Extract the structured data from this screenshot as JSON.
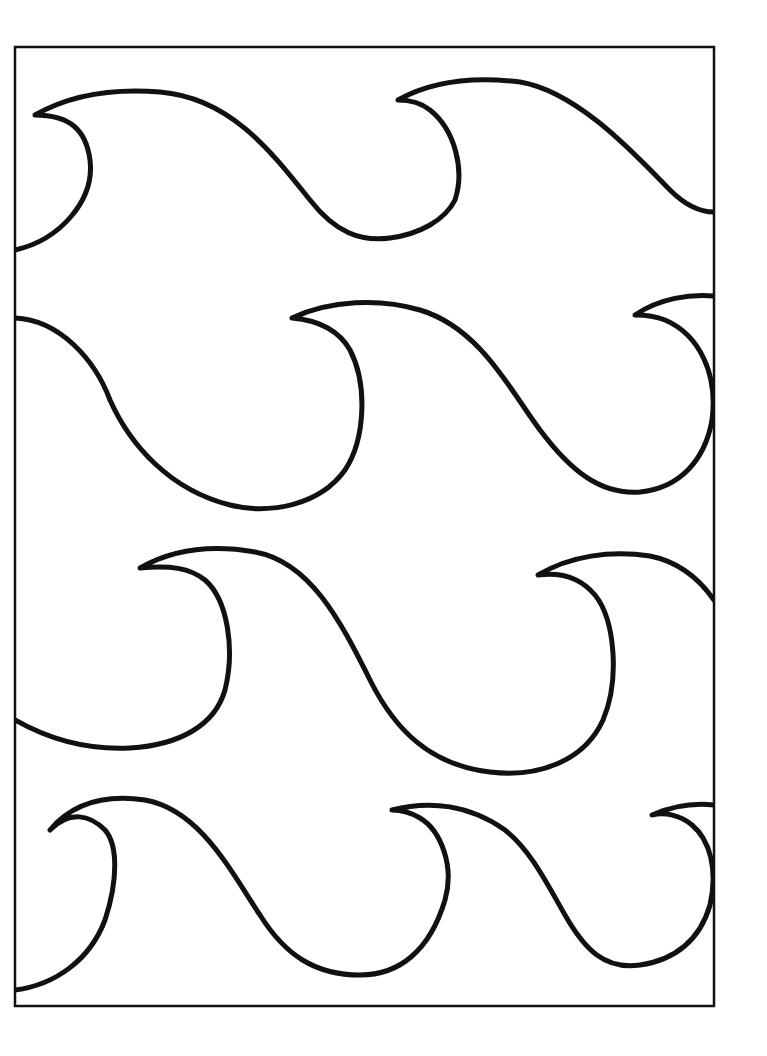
{
  "page": {
    "title": ""
  },
  "frame": {
    "x": 15,
    "y": 47,
    "width": 699,
    "height": 959,
    "stroke": "#111111"
  },
  "colors": {
    "background": "#ffffff",
    "line": "#111111"
  },
  "waves": [
    {
      "row": 1,
      "count": 2
    },
    {
      "row": 2,
      "count": 3
    },
    {
      "row": 3,
      "count": 3
    },
    {
      "row": 4,
      "count": 3
    }
  ]
}
